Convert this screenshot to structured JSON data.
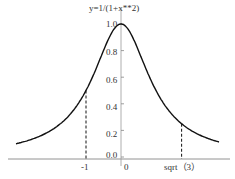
{
  "chart_data": {
    "type": "line",
    "title": "y=1/(1+x**2)",
    "xlabel": "",
    "ylabel": "",
    "function": "1/(1+x^2)",
    "x_range": [
      -3,
      2.8
    ],
    "ylim": [
      0.0,
      1.0
    ],
    "y_ticks": [
      "0.0",
      "0.2",
      "0.4",
      "0.6",
      "0.8",
      "1.0"
    ],
    "x_ticks": [
      {
        "value": -1,
        "label": "-1"
      },
      {
        "value": 0,
        "label": "0"
      },
      {
        "value": 1.732,
        "label": "sqrt (3)"
      }
    ],
    "annotations": [
      {
        "type": "dashed-vline",
        "x": -1,
        "y": 0.5
      },
      {
        "type": "dashed-vline",
        "x": 1.732,
        "y": 0.25
      }
    ],
    "grid": false,
    "legend": null
  },
  "labels": {
    "title": "y=1/(1+x**2)",
    "xtick_neg1": "-1",
    "xtick_0": "0",
    "xtick_sqrt3": "sqrt（3）",
    "y0": "0.0",
    "y1": "0.2",
    "y2": "0.4",
    "y3": "0.6",
    "y4": "0.8",
    "y5": "1.0"
  }
}
